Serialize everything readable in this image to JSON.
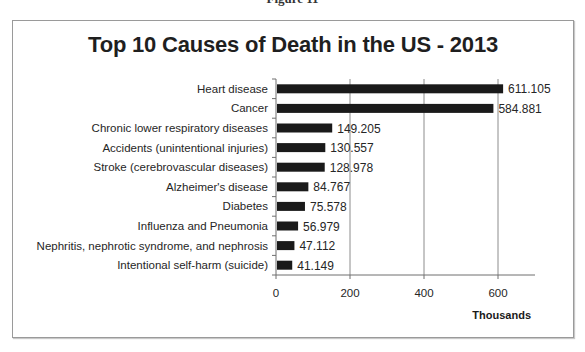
{
  "figure_caption": "Figure 11",
  "chart_data": {
    "type": "bar",
    "orientation": "horizontal",
    "title": "Top 10 Causes of Death in the US - 2013",
    "xlabel": "Thousands",
    "ylabel": "",
    "categories": [
      "Heart disease",
      "Cancer",
      "Chronic lower respiratory diseases",
      "Accidents (unintentional injuries)",
      "Stroke (cerebrovascular diseases)",
      "Alzheimer's disease",
      "Diabetes",
      "Influenza and Pneumonia",
      "Nephritis, nephrotic syndrome, and nephrosis",
      "Intentional self-harm (suicide)"
    ],
    "values": [
      611.105,
      584.881,
      149.205,
      130.557,
      128.978,
      84.767,
      75.578,
      56.979,
      47.112,
      41.149
    ],
    "value_labels": [
      "611.105",
      "584.881",
      "149.205",
      "130.557",
      "128.978",
      "84.767",
      "75.578",
      "56.979",
      "47.112",
      "41.149"
    ],
    "xlim": [
      0,
      700
    ],
    "xticks": [
      0,
      200,
      400,
      600
    ],
    "xtick_labels": [
      "0",
      "200",
      "400",
      "600"
    ],
    "grid": "vertical major gridlines",
    "legend": "none",
    "bar_color": "#1a1a1a"
  }
}
